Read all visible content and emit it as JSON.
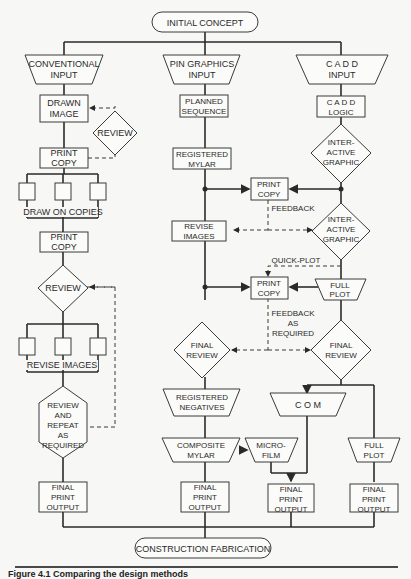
{
  "terminals": {
    "start": "INITIAL CONCEPT",
    "end": "CONSTRUCTION FABRICATION"
  },
  "columns": {
    "conventional": {
      "input": [
        "CONVENTIONAL",
        "INPUT"
      ],
      "drawn_image": [
        "DRAWN",
        "IMAGE"
      ],
      "review_1": "REVIEW",
      "print_copy_1": [
        "PRINT",
        "COPY"
      ],
      "draw_on_copies": "DRAW ON  COPIES",
      "print_copy_2": [
        "PRINT",
        "COPY"
      ],
      "review_2": "REVIEW",
      "revise_images": "REVISE  IMAGES",
      "review_repeat": [
        "REVIEW",
        "AND",
        "REPEAT",
        "AS",
        "REQUIRED"
      ],
      "final_output": [
        "FINAL",
        "PRINT",
        "OUTPUT"
      ]
    },
    "pin_graphics": {
      "input": [
        "PIN GRAPHICS",
        "INPUT"
      ],
      "planned_sequence": [
        "PLANNED",
        "SEQUENCE"
      ],
      "registered_mylar": [
        "REGISTERED",
        "MYLAR"
      ],
      "revise_images": [
        "REVISE",
        "IMAGES"
      ],
      "final_review": [
        "FINAL",
        "REVIEW"
      ],
      "registered_negatives": [
        "REGISTERED",
        "NEGATIVES"
      ],
      "composite_mylar": [
        "COMPOSITE",
        "MYLAR"
      ],
      "final_output": [
        "FINAL",
        "PRINT",
        "OUTPUT"
      ]
    },
    "shared": {
      "print_copy_a": [
        "PRINT",
        "COPY"
      ],
      "feedback": "FEEDBACK",
      "quick_plot": "QUICK-PLOT",
      "print_copy_b": [
        "PRINT",
        "COPY"
      ],
      "feedback_as_required": [
        "FEEDBACK",
        "AS",
        "REQUIRED"
      ],
      "microfilm": [
        "MICRO-",
        "FILM"
      ],
      "final_output": [
        "FINAL",
        "PRINT",
        "OUTPUT"
      ]
    },
    "cadd": {
      "input": [
        "C A D D",
        "INPUT"
      ],
      "logic": [
        "C A D D",
        "LOGIC"
      ],
      "interactive_1": [
        "INTER-",
        "ACTIVE",
        "GRAPHIC"
      ],
      "interactive_2": [
        "INTER-",
        "ACTIVE",
        "GRAPHIC"
      ],
      "full_plot_1": [
        "FULL",
        "PLOT"
      ],
      "final_review": [
        "FINAL",
        "REVIEW"
      ],
      "com": "C O M",
      "full_plot_2": [
        "FULL",
        "PLOT"
      ],
      "final_output": [
        "FINAL",
        "PRINT",
        "OUTPUT"
      ]
    }
  },
  "caption": "Figure 4.1  Comparing the design methods"
}
